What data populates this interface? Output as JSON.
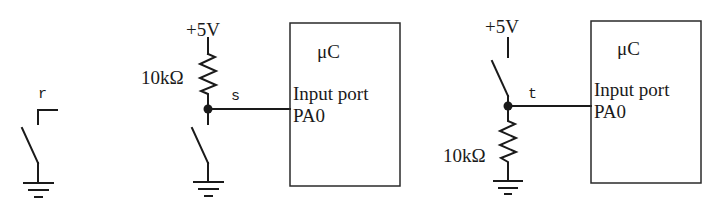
{
  "diagram": {
    "circuits": [
      {
        "id": "r",
        "node_label": "r",
        "description": "switch to ground, open terminal"
      },
      {
        "id": "s",
        "node_label": "s",
        "supply_label": "+5V",
        "resistor_label": "10kΩ",
        "description": "pull-up resistor with switch to ground",
        "mcu": {
          "title": "μC",
          "port_line1": "Input port",
          "port_line2": "PA0"
        }
      },
      {
        "id": "t",
        "node_label": "t",
        "supply_label": "+5V",
        "resistor_label": "10kΩ",
        "description": "switch to +5V with pull-down resistor",
        "mcu": {
          "title": "μC",
          "port_line1": "Input port",
          "port_line2": "PA0"
        }
      }
    ],
    "colors": {
      "line": "#1a1a1a",
      "background": "#ffffff"
    }
  }
}
